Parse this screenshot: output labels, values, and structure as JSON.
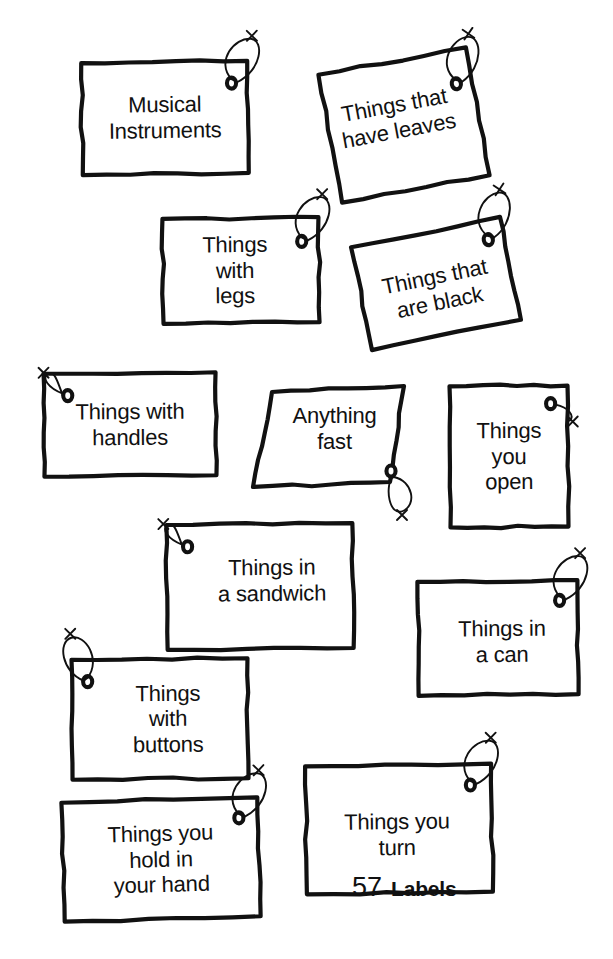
{
  "page": {
    "background_color": "#ffffff",
    "ink_color": "#111111",
    "width": 613,
    "height": 959
  },
  "footer": {
    "page_number": "57",
    "section_name": "Labels"
  },
  "tags": [
    {
      "id": "musical-instruments",
      "text": "Musical\nInstruments",
      "font_size": 22,
      "x": 82,
      "y": 62,
      "w": 166,
      "h": 112,
      "rotate": -0.8,
      "hole": {
        "side": "right",
        "cx": 150,
        "cy": 22
      },
      "string": "loop-up-right"
    },
    {
      "id": "things-that-have-leaves",
      "text": "Things that\nhave leaves",
      "font_size": 22,
      "x": 329,
      "y": 60,
      "w": 150,
      "h": 130,
      "rotate": -10.5,
      "hole": {
        "side": "right",
        "cx": 134,
        "cy": 34
      },
      "string": "loop-up-right"
    },
    {
      "id": "things-with-legs",
      "text": "Things\nwith\nlegs",
      "font_size": 22,
      "x": 163,
      "y": 218,
      "w": 156,
      "h": 105,
      "rotate": -0.6,
      "hole": {
        "side": "right",
        "cx": 139,
        "cy": 24
      },
      "string": "loop-up-right"
    },
    {
      "id": "things-that-are-black",
      "text": "Things that\nare black",
      "font_size": 22,
      "x": 360,
      "y": 231,
      "w": 152,
      "h": 105,
      "rotate": -11.5,
      "hole": {
        "side": "right",
        "cx": 136,
        "cy": 20
      },
      "string": "loop-up-right"
    },
    {
      "id": "things-with-handles",
      "text": "Things with\nhandles",
      "font_size": 22,
      "x": 44,
      "y": 373,
      "w": 172,
      "h": 103,
      "rotate": -0.5,
      "hole": {
        "side": "left",
        "cx": 24,
        "cy": 22
      },
      "string": "diag-up-left"
    },
    {
      "id": "anything-fast",
      "text": "Anything\nfast",
      "font_size": 22,
      "x": 253,
      "y": 386,
      "w": 151,
      "h": 101,
      "rotate": 0,
      "quad": [
        [
          19,
          6
        ],
        [
          151,
          0
        ],
        [
          137,
          96
        ],
        [
          0,
          101
        ]
      ],
      "hole": {
        "side": "right",
        "cx": 138,
        "cy": 85
      },
      "string": "loop-down"
    },
    {
      "id": "things-you-open",
      "text": "Things\nyou\nopen",
      "font_size": 22,
      "x": 450,
      "y": 386,
      "w": 118,
      "h": 141,
      "rotate": -0.4,
      "hole": {
        "side": "right",
        "cx": 101,
        "cy": 18
      },
      "string": "short-right"
    },
    {
      "id": "things-in-a-sandwich",
      "text": "Things in\na sandwich",
      "font_size": 22,
      "x": 167,
      "y": 524,
      "w": 186,
      "h": 125,
      "rotate": -0.6,
      "hole": {
        "side": "left",
        "cx": 21,
        "cy": 22
      },
      "string": "diag-up-left"
    },
    {
      "id": "things-in-a-can",
      "text": "Things in\na can",
      "font_size": 22,
      "x": 418,
      "y": 581,
      "w": 160,
      "h": 114,
      "rotate": -0.6,
      "hole": {
        "side": "right",
        "cx": 142,
        "cy": 20
      },
      "string": "loop-up-right"
    },
    {
      "id": "things-with-buttons",
      "text": "Things\nwith\nbuttons",
      "font_size": 22,
      "x": 72,
      "y": 659,
      "w": 176,
      "h": 120,
      "rotate": -0.5,
      "hole": {
        "side": "left",
        "cx": 16,
        "cy": 22
      },
      "string": "loop-up-left"
    },
    {
      "id": "things-you-turn",
      "text": "Things you\nturn",
      "font_size": 22,
      "x": 306,
      "y": 765,
      "w": 186,
      "h": 128,
      "rotate": -0.8,
      "hole": {
        "side": "right",
        "cx": 165,
        "cy": 21
      },
      "string": "loop-up-right"
    },
    {
      "id": "things-you-hold-in-your-hand",
      "text": "Things you\nhold in\nyour hand",
      "font_size": 22,
      "x": 63,
      "y": 800,
      "w": 196,
      "h": 119,
      "rotate": -1.6,
      "hole": {
        "side": "right",
        "cx": 177,
        "cy": 20
      },
      "string": "loop-up-right"
    }
  ]
}
